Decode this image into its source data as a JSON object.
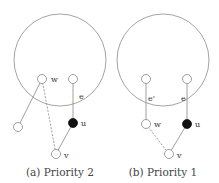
{
  "panels": [
    {
      "caption": "(a) Priority 2",
      "circle": {
        "cx": 60,
        "cy": 60,
        "r": 46
      },
      "nodes": {
        "w": {
          "x": 42,
          "y": 79,
          "label": "w",
          "filled": false
        },
        "top_right": {
          "x": 73,
          "y": 79,
          "filled": false
        },
        "left": {
          "x": 18,
          "y": 127,
          "filled": false
        },
        "u": {
          "x": 73,
          "y": 123,
          "label": "u",
          "filled": true
        },
        "v": {
          "x": 56,
          "y": 154,
          "label": "v",
          "filled": false
        }
      },
      "edge_labels": {
        "e": "e"
      }
    },
    {
      "caption": "(b) Priority 1",
      "circle": {
        "cx": 163,
        "cy": 60,
        "r": 46
      },
      "nodes": {
        "top_left": {
          "x": 146,
          "y": 79,
          "filled": false
        },
        "top_right": {
          "x": 187,
          "y": 79,
          "filled": false
        },
        "w": {
          "x": 146,
          "y": 124,
          "label": "w",
          "filled": false
        },
        "u": {
          "x": 187,
          "y": 124,
          "label": "u",
          "filled": true
        },
        "v": {
          "x": 169,
          "y": 154,
          "label": "v",
          "filled": false
        }
      },
      "edge_labels": {
        "e_prime": "e'",
        "e": "e"
      }
    }
  ],
  "colors": {
    "stroke": "#888888",
    "filled_node": "#111111"
  }
}
